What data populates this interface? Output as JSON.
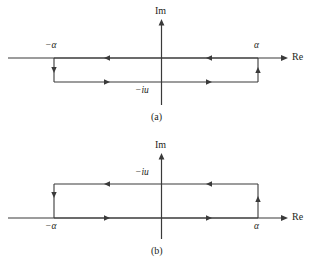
{
  "figure": {
    "background_color": "#ffffff",
    "line_color": "#3a3a3a",
    "text_color": "#231f20"
  },
  "panels": [
    {
      "caption": "(a)",
      "axis_labels": {
        "imaginary": "Im",
        "real": "Re"
      },
      "point_labels": {
        "left": "−α",
        "right": "α",
        "depth": "−iu"
      },
      "contour": {
        "description": "rectangular contour below the real axis",
        "orientation": "clockwise",
        "edges": [
          {
            "name": "top",
            "direction": "leftward",
            "arrow_count": 2
          },
          {
            "name": "left",
            "direction": "downward",
            "arrow_count": 1
          },
          {
            "name": "bottom",
            "direction": "rightward",
            "arrow_count": 2
          },
          {
            "name": "right",
            "direction": "upward",
            "arrow_count": 1
          }
        ]
      }
    },
    {
      "caption": "(b)",
      "axis_labels": {
        "imaginary": "Im",
        "real": "Re"
      },
      "point_labels": {
        "left": "−α",
        "right": "α",
        "depth": "−iu"
      },
      "contour": {
        "description": "rectangular contour above the real axis",
        "orientation": "clockwise",
        "edges": [
          {
            "name": "top",
            "direction": "leftward",
            "arrow_count": 2
          },
          {
            "name": "left",
            "direction": "downward",
            "arrow_count": 1
          },
          {
            "name": "bottom",
            "direction": "rightward",
            "arrow_count": 2
          },
          {
            "name": "right",
            "direction": "upward",
            "arrow_count": 1
          }
        ]
      }
    }
  ]
}
